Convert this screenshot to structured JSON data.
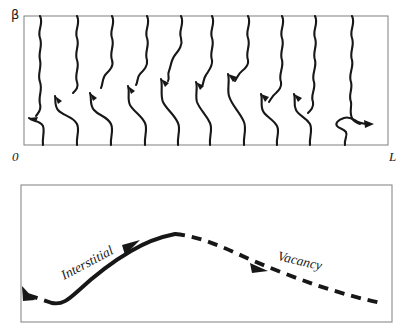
{
  "figure": {
    "type": "diagram",
    "background_color": "#ffffff",
    "line_color": "#171717",
    "frame_color": "#8a8a8a"
  },
  "top_panel": {
    "name": "world-lines-panel",
    "description": "Wavy near-vertical world lines drifting to the right inside a rectangular frame",
    "frame": {
      "x": 24,
      "y": 16,
      "width": 364,
      "height": 129
    },
    "labels": {
      "y_axis": "β",
      "origin": "0",
      "x_end": "L"
    },
    "world_lines": [
      {
        "bottom_x": 43,
        "top_x": 40,
        "arrow": true
      },
      {
        "bottom_x": 77,
        "top_x": 77,
        "arrow": true
      },
      {
        "bottom_x": 111,
        "top_x": 112,
        "arrow": true
      },
      {
        "bottom_x": 145,
        "top_x": 147,
        "arrow": true
      },
      {
        "bottom_x": 178,
        "top_x": 181,
        "arrow": true
      },
      {
        "bottom_x": 210,
        "top_x": 212,
        "arrow": true
      },
      {
        "bottom_x": 244,
        "top_x": 248,
        "arrow": true
      },
      {
        "bottom_x": 277,
        "top_x": 282,
        "arrow": true
      },
      {
        "bottom_x": 310,
        "top_x": 315,
        "arrow": true
      },
      {
        "bottom_x": 345,
        "top_x": 352,
        "arrow": true
      }
    ]
  },
  "bottom_panel": {
    "name": "migration-path-panel",
    "description": "A path rising as a solid line then falling as a dashed line inside a rectangular frame",
    "frame": {
      "x": 21,
      "y": 185,
      "width": 371,
      "height": 137
    },
    "segments": [
      {
        "label": "Interstitial",
        "style": "solid",
        "arrow": true
      },
      {
        "label": "Vacancy",
        "style": "dashed",
        "arrow": true
      }
    ],
    "labels": {
      "interstitial": "Interstitial",
      "vacancy": "Vacancy"
    }
  }
}
